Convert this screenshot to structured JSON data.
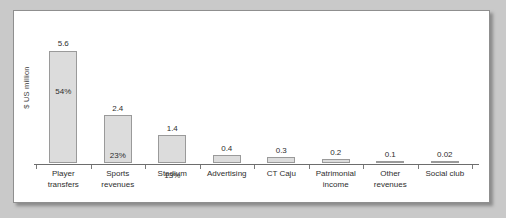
{
  "chart_data": {
    "type": "bar",
    "title": "",
    "xlabel": "",
    "ylabel": "$ US million",
    "ylim": [
      0,
      6.2
    ],
    "grid": false,
    "legend": false,
    "categories": [
      "Player transfers",
      "Sports revenues",
      "Stadium",
      "Advertising",
      "CT Caju",
      "Patrimonial income",
      "Other revenues",
      "Social club"
    ],
    "category_lines": [
      [
        "Player",
        "transfers"
      ],
      [
        "Sports",
        "revenues"
      ],
      [
        "Stadium"
      ],
      [
        "Advertising"
      ],
      [
        "CT Caju"
      ],
      [
        "Patrimonial",
        "income"
      ],
      [
        "Other",
        "revenues"
      ],
      [
        "Social club"
      ]
    ],
    "values": [
      5.6,
      2.4,
      1.4,
      0.4,
      0.3,
      0.2,
      0.1,
      0.02
    ],
    "value_labels": [
      "5.6",
      "2.4",
      "1.4",
      "0.4",
      "0.3",
      "0.2",
      "0.1",
      "0.02"
    ],
    "percent_labels": [
      "54%",
      "23%",
      "13%",
      "",
      "",
      "",
      "",
      ""
    ],
    "colors": {
      "bar_fill": "#dcdcdc",
      "bar_stroke": "#9a9a9a",
      "axis": "#6d6d6d",
      "text": "#2e2e2e",
      "panel": "#ffffff",
      "page": "#c9c9c9",
      "frame": "#8f8f8f"
    }
  }
}
